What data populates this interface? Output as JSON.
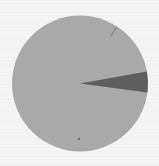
{
  "chart_data": {
    "type": "pie",
    "title": "",
    "categories": [
      "Major share",
      "Small share",
      "Tiny share"
    ],
    "values": [
      94.8,
      4.9,
      0.3
    ],
    "colors": [
      "#a9a9a9",
      "#5e5e5e",
      "#6a6a6a"
    ],
    "start_angle_deg": 7.5,
    "legend": "none",
    "labels_visible": false
  },
  "page": {
    "background": "#f4f4f4"
  }
}
